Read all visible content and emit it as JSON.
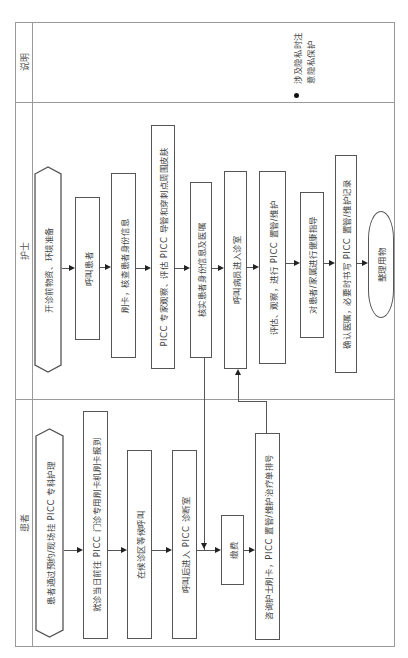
{
  "lanes": {
    "notes": {
      "label": "说明"
    },
    "nurse": {
      "label": "护士"
    },
    "patient": {
      "label": "患者"
    }
  },
  "notes": {
    "items": [
      {
        "line1": "涉及隐私时注",
        "line2": "意隐私保护"
      }
    ]
  },
  "nurse_steps": [
    {
      "text": "开诊前物资、环境准备",
      "shape": "hexagon"
    },
    {
      "text": "呼叫患者",
      "shape": "rect"
    },
    {
      "text": "刷卡，核查患者身份信息",
      "shape": "rect"
    },
    {
      "text": "PICC 专家观察、评估 PICC 导管和穿刺点周围皮肤",
      "shape": "rect"
    },
    {
      "text": "核实患者身份信息及医嘱",
      "shape": "rect"
    },
    {
      "text": "呼叫病员进入诊室",
      "shape": "rect"
    },
    {
      "text": "评估、观察，进行 PICC 置管/维护",
      "shape": "rect"
    },
    {
      "text": "对患者/家属进行健康指导",
      "shape": "rect"
    },
    {
      "text": "确认医嘱，必要时书写 PICC 置管/维护记录",
      "shape": "rect"
    },
    {
      "text": "整理用物",
      "shape": "oval"
    }
  ],
  "patient_steps": [
    {
      "text": "患者通过预约/现场挂 PICC 专科护理",
      "shape": "hexagon"
    },
    {
      "text": "就诊当日前往 PICC 门诊专用刷卡机刷卡报到",
      "shape": "rect"
    },
    {
      "text": "在候诊区等候呼叫",
      "shape": "rect"
    },
    {
      "text": "呼叫后进入 PICC 诊断室",
      "shape": "rect"
    },
    {
      "text": "缴费",
      "shape": "rect"
    },
    {
      "text": "咨询护士刷卡，PICC 置管/维护治疗单排号",
      "shape": "rect"
    }
  ],
  "colors": {
    "frame": "#9a9a9a",
    "box_border": "#555555",
    "arrow": "#222222",
    "text": "#444444"
  }
}
